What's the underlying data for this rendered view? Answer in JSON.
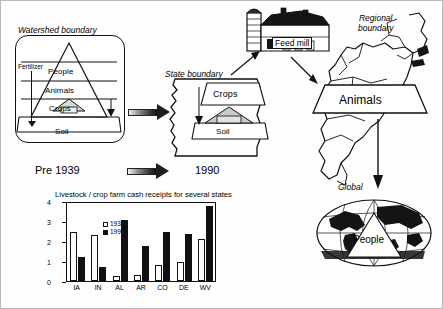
{
  "diagram": {
    "watershed": {
      "caption": "Watershed boundary",
      "fertilizer_label": "Fertilizer",
      "tiers": [
        "People",
        "Animals",
        "Crops"
      ],
      "base": "Soil"
    },
    "state": {
      "caption": "State boundary",
      "crops": "Crops",
      "soil": "Soil"
    },
    "feed_mill": {
      "label": "Feed mill"
    },
    "regional": {
      "caption_line1": "Regional",
      "caption_line2": "boundary",
      "animals": "Animals"
    },
    "global": {
      "caption": "Global",
      "people": "People"
    },
    "era_left": "Pre 1939",
    "era_right": "1990"
  },
  "chart_data": {
    "type": "bar",
    "title": "Livestock / crop farm cash receipts for several states",
    "categories": [
      "IA",
      "IN",
      "AL",
      "AR",
      "CO",
      "DE",
      "WV"
    ],
    "series": [
      {
        "name": "1933",
        "values": [
          2.5,
          2.35,
          0.25,
          0.3,
          0.8,
          1.0,
          2.15
        ]
      },
      {
        "name": "1990",
        "values": [
          1.25,
          0.7,
          3.15,
          1.8,
          2.5,
          2.4,
          3.85
        ]
      }
    ],
    "legend": [
      "1933",
      "1990"
    ],
    "yticks": [
      0,
      1,
      2,
      3,
      4
    ],
    "ylim": [
      0,
      4
    ],
    "xlabel": "",
    "ylabel": "",
    "grid": false,
    "legend_position": "top-left"
  },
  "colors": {
    "ink": "#111111",
    "paper": "#ffffff",
    "series_1933": "#ffffff",
    "series_1990": "#111111"
  }
}
